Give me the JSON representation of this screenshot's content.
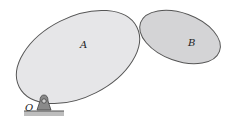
{
  "diagram": {
    "bodies": [
      {
        "label": "A",
        "fill": "#e6e6e8",
        "stroke": "#555555"
      },
      {
        "label": "B",
        "fill": "#d4d4d6",
        "stroke": "#555555"
      }
    ],
    "pin": {
      "label": "O",
      "fill": "#8a8a8a"
    },
    "ground": {
      "fill": "#bdbdbd"
    }
  }
}
